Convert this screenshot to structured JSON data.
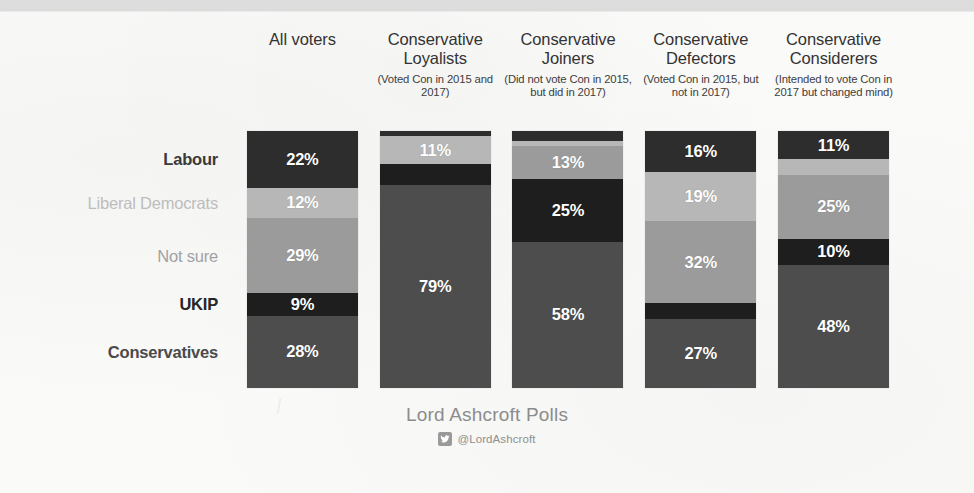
{
  "footer": {
    "brand": "Lord Ashcroft Polls",
    "handle": "@LordAshcroft",
    "twitter_icon": "twitter-bird-icon"
  },
  "palette": {
    "labour": "#2d2d2d",
    "libdem": "#b7b7b7",
    "notsure": "#9b9b9b",
    "ukip": "#1e1e1e",
    "conservatives": "#4d4d4d",
    "page_background": "#fafaf9",
    "value_text": "#ffffff"
  },
  "chart_data": {
    "type": "bar",
    "subtype": "stacked-100-percent",
    "title": "",
    "xlabel": "",
    "ylabel": "",
    "ylim": [
      0,
      100
    ],
    "grid": false,
    "legend_position": "left-row-labels",
    "categories": [
      "All voters",
      "Conservative Loyalists",
      "Conservative Joiners",
      "Conservative Defectors",
      "Conservative Considerers"
    ],
    "category_sublabels": [
      "",
      "(Voted Con in 2015 and 2017)",
      "(Did not vote Con in 2015, but did in 2017)",
      "(Voted Con in 2015, but not in 2017)",
      "(Intended to vote Con in 2017 but changed mind)"
    ],
    "series": [
      {
        "name": "Labour",
        "color": "#2d2d2d",
        "values": [
          22,
          2,
          4,
          16,
          11
        ]
      },
      {
        "name": "Liberal Democrats",
        "color": "#b7b7b7",
        "values": [
          12,
          11,
          2,
          19,
          6
        ]
      },
      {
        "name": "Not sure",
        "color": "#9b9b9b",
        "values": [
          29,
          0,
          13,
          32,
          25
        ]
      },
      {
        "name": "UKIP",
        "color": "#1e1e1e",
        "values": [
          9,
          8,
          25,
          6,
          10
        ]
      },
      {
        "name": "Conservatives",
        "color": "#4d4d4d",
        "values": [
          28,
          79,
          58,
          27,
          48
        ]
      }
    ],
    "labels_shown": {
      "All voters": [
        "22%",
        "12%",
        "29%",
        "9%",
        "28%"
      ],
      "Conservative Loyalists": [
        "",
        "11%",
        "",
        "",
        "79%"
      ],
      "Conservative Joiners": [
        "",
        "",
        "13%",
        "25%",
        "58%"
      ],
      "Conservative Defectors": [
        "16%",
        "19%",
        "32%",
        "",
        "27%"
      ],
      "Conservative Considerers": [
        "11%",
        "",
        "25%",
        "10%",
        "48%"
      ]
    }
  },
  "row_labels": [
    {
      "text": "Labour",
      "color": "#3a3a3a",
      "weight": "bold",
      "center_pct": 11.0
    },
    {
      "text": "Liberal Democrats",
      "color": "#bdbdbd",
      "weight": "normal",
      "center_pct": 28.0
    },
    {
      "text": "Not sure",
      "color": "#a2a2a2",
      "weight": "normal",
      "center_pct": 48.5
    },
    {
      "text": "UKIP",
      "color": "#262626",
      "weight": "bold",
      "center_pct": 67.5
    },
    {
      "text": "Conservatives",
      "color": "#4a4a4a",
      "weight": "bold",
      "center_pct": 86.0
    }
  ],
  "columns": [
    {
      "title": "All voters",
      "sub": "",
      "segments": [
        {
          "series": "Labour",
          "pct": 22,
          "color": "#2d2d2d",
          "label": "22%"
        },
        {
          "series": "Liberal Democrats",
          "pct": 12,
          "color": "#b7b7b7",
          "label": "12%"
        },
        {
          "series": "Not sure",
          "pct": 29,
          "color": "#9b9b9b",
          "label": "29%"
        },
        {
          "series": "UKIP",
          "pct": 9,
          "color": "#1e1e1e",
          "label": "9%"
        },
        {
          "series": "Conservatives",
          "pct": 28,
          "color": "#4d4d4d",
          "label": "28%"
        }
      ]
    },
    {
      "title": "Conservative Loyalists",
      "sub": "(Voted Con in 2015 and 2017)",
      "segments": [
        {
          "series": "Labour",
          "pct": 2,
          "color": "#2d2d2d",
          "label": ""
        },
        {
          "series": "Liberal Democrats",
          "pct": 11,
          "color": "#b7b7b7",
          "label": "11%"
        },
        {
          "series": "UKIP",
          "pct": 8,
          "color": "#1e1e1e",
          "label": ""
        },
        {
          "series": "Conservatives",
          "pct": 79,
          "color": "#4d4d4d",
          "label": "79%"
        }
      ]
    },
    {
      "title": "Conservative Joiners",
      "sub": "(Did not vote Con in 2015, but did in 2017)",
      "segments": [
        {
          "series": "Labour",
          "pct": 4,
          "color": "#2d2d2d",
          "label": ""
        },
        {
          "series": "Liberal Democrats",
          "pct": 2,
          "color": "#b7b7b7",
          "label": ""
        },
        {
          "series": "Not sure",
          "pct": 13,
          "color": "#9b9b9b",
          "label": "13%"
        },
        {
          "series": "UKIP",
          "pct": 25,
          "color": "#1e1e1e",
          "label": "25%"
        },
        {
          "series": "Conservatives",
          "pct": 58,
          "color": "#4d4d4d",
          "label": "58%"
        }
      ]
    },
    {
      "title": "Conservative Defectors",
      "sub": "(Voted Con in 2015, but not in 2017)",
      "segments": [
        {
          "series": "Labour",
          "pct": 16,
          "color": "#2d2d2d",
          "label": "16%"
        },
        {
          "series": "Liberal Democrats",
          "pct": 19,
          "color": "#b7b7b7",
          "label": "19%"
        },
        {
          "series": "Not sure",
          "pct": 32,
          "color": "#9b9b9b",
          "label": "32%"
        },
        {
          "series": "UKIP",
          "pct": 6,
          "color": "#1e1e1e",
          "label": ""
        },
        {
          "series": "Conservatives",
          "pct": 27,
          "color": "#4d4d4d",
          "label": "27%"
        }
      ]
    },
    {
      "title": "Conservative Considerers",
      "sub": "(Intended to vote Con in 2017 but changed mind)",
      "segments": [
        {
          "series": "Labour",
          "pct": 11,
          "color": "#2d2d2d",
          "label": "11%"
        },
        {
          "series": "Liberal Democrats",
          "pct": 6,
          "color": "#b7b7b7",
          "label": ""
        },
        {
          "series": "Not sure",
          "pct": 25,
          "color": "#9b9b9b",
          "label": "25%"
        },
        {
          "series": "UKIP",
          "pct": 10,
          "color": "#1e1e1e",
          "label": "10%"
        },
        {
          "series": "Conservatives",
          "pct": 48,
          "color": "#4d4d4d",
          "label": "48%"
        }
      ]
    }
  ]
}
